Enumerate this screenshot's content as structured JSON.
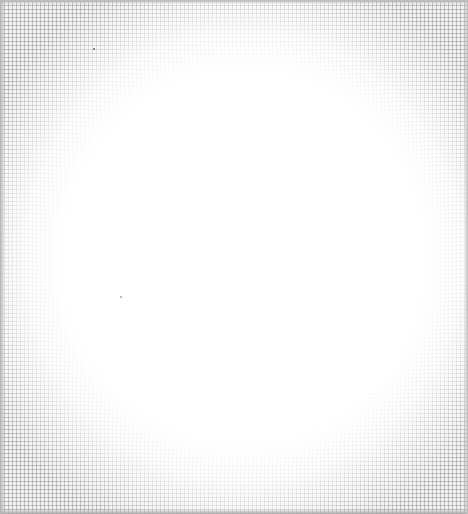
{
  "page": {
    "grid_color": "#969696",
    "paper_color": "#ffffff"
  }
}
